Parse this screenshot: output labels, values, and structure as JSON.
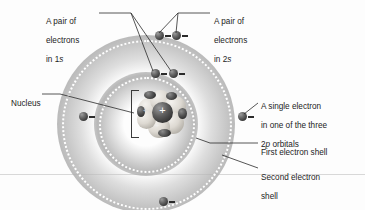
{
  "figure": {
    "background_color": "#fdfdfd",
    "width": 365,
    "height": 210
  },
  "labels": {
    "pair_1s": {
      "line1": "A pair of",
      "line2": "electrons",
      "line3_prefix": "in 1",
      "line3_italic": "s"
    },
    "pair_2s": {
      "line1": "A pair of",
      "line2": "electrons",
      "line3_prefix": "in 2",
      "line3_italic": "s"
    },
    "nucleus": {
      "text": "Nucleus"
    },
    "single_2p": {
      "line1": "A single electron",
      "line2": "in one of the three",
      "line3_prefix": "2",
      "line3_italic": "p",
      "line3_suffix": " orbitals"
    },
    "first_shell": {
      "text": "First electron shell"
    },
    "second_shell": {
      "line1": "Second electron",
      "line2": "shell"
    }
  },
  "nucleus": {
    "charge_symbol": "+",
    "lobe_count": 7,
    "description": "Cluster of pale protons and neutrons around a dark central sphere"
  },
  "electrons": {
    "charge_symbol": "−",
    "count": 6,
    "items": [
      {
        "name": "electron-2s-a",
        "shell": "second",
        "x": 155,
        "y": 31
      },
      {
        "name": "electron-2s-b",
        "shell": "second",
        "x": 172,
        "y": 31
      },
      {
        "name": "electron-1s-a",
        "shell": "first",
        "x": 151,
        "y": 69
      },
      {
        "name": "electron-1s-b",
        "shell": "first",
        "x": 169,
        "y": 69
      },
      {
        "name": "electron-2p-left",
        "shell": "second",
        "x": 79,
        "y": 115
      },
      {
        "name": "electron-2p-right",
        "shell": "second",
        "x": 238,
        "y": 115
      },
      {
        "name": "electron-2p-bottom",
        "shell": "second",
        "x": 159,
        "y": 199
      }
    ]
  },
  "shells": {
    "first": {
      "label": "First electron shell",
      "radius": 48
    },
    "second": {
      "label": "Second electron shell",
      "radius": 85
    }
  },
  "colors": {
    "shell_gray": "#b0b0b0",
    "dotted_ring": "#ffffff",
    "electron_dark": "#3a3a3a",
    "nucleus_core": "#2e2e2e",
    "nucleus_lobe": "#ddd9d2",
    "leader_line": "#2b2b2b",
    "text": "#1c1c1c",
    "page_rule": "#d8d8d8"
  }
}
